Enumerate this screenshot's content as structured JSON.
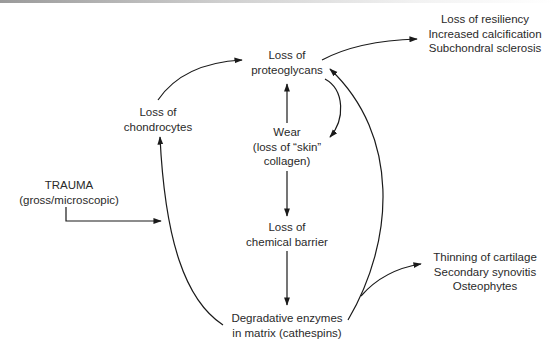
{
  "diagram": {
    "title": "",
    "nodes": {
      "proteoglycans": {
        "lines": [
          "Loss of",
          "proteoglycans"
        ]
      },
      "chondrocytes": {
        "lines": [
          "Loss of",
          "chondrocytes"
        ]
      },
      "wear": {
        "lines": [
          "Wear",
          "(loss of “skin”",
          "collagen)"
        ]
      },
      "chemical_barrier": {
        "lines": [
          "Loss of",
          "chemical barrier"
        ]
      },
      "enzymes": {
        "lines": [
          "Degradative enzymes",
          "in matrix (cathespins)"
        ]
      },
      "trauma": {
        "lines": [
          "TRAUMA",
          "(gross/microscopic)"
        ]
      },
      "outcome_top": {
        "lines": [
          "Loss of resiliency",
          "Increased calcification",
          "Subchondral sclerosis"
        ]
      },
      "outcome_bottom": {
        "lines": [
          "Thinning of cartilage",
          "Secondary synovitis",
          "Osteophytes"
        ]
      }
    },
    "edges": [
      {
        "from": "chondrocytes",
        "to": "proteoglycans"
      },
      {
        "from": "wear",
        "to": "proteoglycans"
      },
      {
        "from": "proteoglycans",
        "to": "wear"
      },
      {
        "from": "proteoglycans",
        "to": "outcome_top"
      },
      {
        "from": "wear",
        "to": "chemical_barrier"
      },
      {
        "from": "chemical_barrier",
        "to": "enzymes"
      },
      {
        "from": "enzymes",
        "to": "chondrocytes"
      },
      {
        "from": "enzymes",
        "to": "proteoglycans"
      },
      {
        "from": "enzymes",
        "to": "outcome_bottom"
      },
      {
        "from": "trauma",
        "to": "enzymes-chondrocytes-path"
      }
    ],
    "colors": {
      "line": "#1a1a1a",
      "text": "#2a2a2a",
      "background": "#ffffff"
    }
  }
}
